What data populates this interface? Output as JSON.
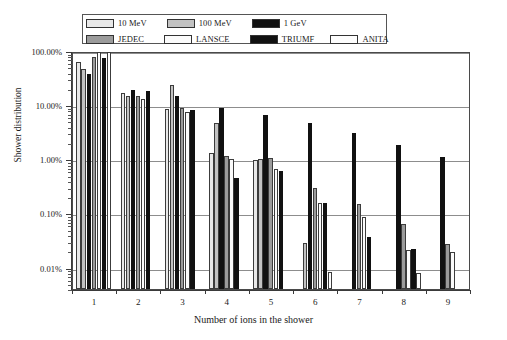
{
  "chart_data": {
    "type": "bar",
    "title": "",
    "xlabel": "Number of ions in the shower",
    "ylabel": "Shower distribution",
    "yscale": "log",
    "ylim": [
      0.004,
      100
    ],
    "ytick_labels": [
      "100.00%",
      "10.00%",
      "1.00%",
      "0.10%",
      "0.01%"
    ],
    "ytick_values": [
      100,
      10,
      1,
      0.1,
      0.01
    ],
    "grid": true,
    "legend_position": "top",
    "categories": [
      "1",
      "2",
      "3",
      "4",
      "5",
      "6",
      "7",
      "8",
      "9"
    ],
    "series": [
      {
        "name": "10 MeV",
        "color": "#e8e8e8",
        "values": [
          62,
          17,
          8.5,
          1.3,
          0.95,
          null,
          null,
          null,
          null
        ]
      },
      {
        "name": "100 MeV",
        "color": "#c2c2c2",
        "values": [
          46,
          15,
          24,
          4.6,
          1.0,
          0.028,
          null,
          null,
          null
        ]
      },
      {
        "name": "1 GeV",
        "color": "#111111",
        "values": [
          38,
          19,
          14.5,
          9.0,
          6.6,
          4.7,
          3.0,
          1.85,
          1.1
        ]
      },
      {
        "name": "JEDEC",
        "color": "#9b9b9b",
        "values": [
          78,
          15,
          9.0,
          1.15,
          1.05,
          0.3,
          0.15,
          0.063,
          0.027
        ]
      },
      {
        "name": "LANSCE",
        "color": "#fbfbfb",
        "values": [
          95,
          13,
          7.5,
          1.0,
          0.66,
          0.155,
          0.087,
          0.021,
          0.0195
        ]
      },
      {
        "name": "TRIUMF",
        "color": "#111111",
        "values": [
          74,
          18,
          8.0,
          0.45,
          0.6,
          0.155,
          0.036,
          0.022,
          0.0035
        ]
      },
      {
        "name": "ANITA",
        "color": "#fdfdfd",
        "values": [
          96,
          null,
          null,
          null,
          null,
          0.0082,
          null,
          0.0078,
          null
        ]
      }
    ]
  },
  "legend": {
    "rows": [
      [
        {
          "label": "10 MeV",
          "color": "#e8e8e8"
        },
        {
          "label": "100 MeV",
          "color": "#c2c2c2"
        },
        {
          "label": "1 GeV",
          "color": "#111111"
        }
      ],
      [
        {
          "label": "JEDEC",
          "color": "#9b9b9b"
        },
        {
          "label": "LANSCE",
          "color": "#fbfbfb"
        },
        {
          "label": "TRIUMF",
          "color": "#111111"
        },
        {
          "label": "ANITA",
          "color": "#fdfdfd"
        }
      ]
    ]
  }
}
